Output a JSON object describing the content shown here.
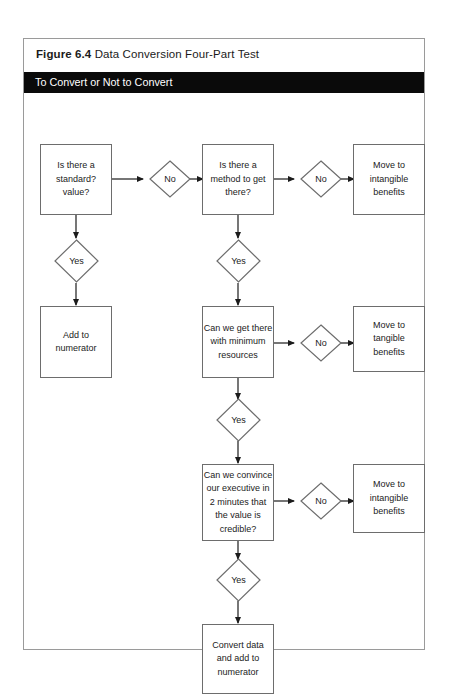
{
  "figure": {
    "number": "Figure 6.4",
    "title": "Data Conversion Four-Part Test",
    "banner": "To Convert or Not to Convert"
  },
  "colors": {
    "banner_background": "#0a0a0a",
    "banner_text": "#ffffff",
    "frame_border": "#9a9a9a",
    "node_border": "#6d6d6d",
    "node_fill": "#ffffff",
    "connector": "#1b1b1b",
    "text": "#1b1b1b"
  },
  "flow": {
    "boxes": [
      {
        "id": "q1",
        "label": "Is there a\nstandard?\nvalue?"
      },
      {
        "id": "q2",
        "label": "Is there a\nmethod to get\nthere?"
      },
      {
        "id": "out1",
        "label": "Move to\nintangible\nbenefits"
      },
      {
        "id": "add",
        "label": "Add to\nnumerator"
      },
      {
        "id": "q3",
        "label": "Can  we get there\nwith minimum\nresources"
      },
      {
        "id": "out2",
        "label": "Move to\ntangible\nbenefits"
      },
      {
        "id": "q4",
        "label": "Can we convince\nour executive in\n2 minutes that\nthe value is\ncredible?"
      },
      {
        "id": "out3",
        "label": "Move to\nintangible\nbenefits"
      },
      {
        "id": "final",
        "label": "Convert data\nand add to\nnumerator"
      }
    ],
    "diamonds": [
      {
        "id": "no1",
        "label": "No"
      },
      {
        "id": "no2",
        "label": "No"
      },
      {
        "id": "yes1",
        "label": "Yes"
      },
      {
        "id": "yes2",
        "label": "Yes"
      },
      {
        "id": "no3",
        "label": "No"
      },
      {
        "id": "yes3",
        "label": "Yes"
      },
      {
        "id": "no4",
        "label": "No"
      },
      {
        "id": "yes4",
        "label": "Yes"
      }
    ]
  }
}
